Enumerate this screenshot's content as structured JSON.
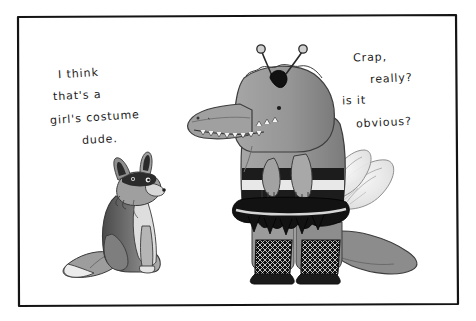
{
  "comic": {
    "panel": {
      "name": "single-panel-cartoon",
      "background_color": "#ffffff",
      "border_color": "#141414",
      "border_style": "hand-drawn-rectangle",
      "frame": {
        "x": 17,
        "y": 16,
        "width": 441,
        "height": 290
      }
    },
    "dialogue": {
      "fox": {
        "speaker": "fox",
        "lines": [
          "I  think",
          "that's  a",
          "girl's costume",
          "dude."
        ],
        "full_text": "I think that's a girl's costume dude.",
        "color": "#1b1b1b"
      },
      "alligator": {
        "speaker": "alligator",
        "lines": [
          "Crap,",
          "really?",
          "is it",
          "obvious?"
        ],
        "full_text": "Crap, really? is it obvious?",
        "color": "#1b1b1b"
      }
    },
    "characters": [
      {
        "id": "fox",
        "label": "sitting fox",
        "description": "grey fox sitting upright facing right, dark eye mask, pointed ears, bushy tail with white tip",
        "fill_dark": "#3a3a3a",
        "fill_mid": "#8f8f8f",
        "fill_light": "#d8d8d8"
      },
      {
        "id": "alligator",
        "label": "alligator in bee costume",
        "description": "grey alligator standing, wearing antennae headband, striped bee body, black tutu, fishnet stockings and translucent wings",
        "body_fill": "#9a9a9a",
        "body_shade": "#7c7c7c",
        "costume_stripe_dark": "#1c1c1c",
        "costume_stripe_light": "#e6e6e6",
        "tutu_color": "#121212",
        "wing_fill": "#f0f0f0"
      }
    ],
    "props": [
      {
        "id": "antennae",
        "label": "bee antennae headband",
        "color": "#121212"
      },
      {
        "id": "wings",
        "label": "bee wings",
        "color": "#f0f0f0"
      },
      {
        "id": "tutu",
        "label": "black tutu skirt",
        "color": "#121212"
      },
      {
        "id": "stockings",
        "label": "fishnet stockings",
        "color": "#2a2a2a"
      }
    ]
  }
}
